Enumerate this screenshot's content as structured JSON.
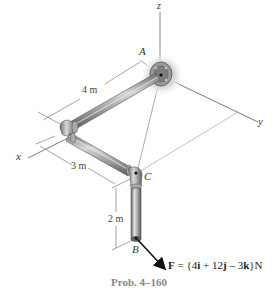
{
  "figure": {
    "caption": "Prob. 4–160",
    "axes": {
      "x": "x",
      "y": "y",
      "z": "z"
    },
    "points": {
      "A": "A",
      "B": "B",
      "C": "C"
    },
    "dimensions": {
      "AD": "4 m",
      "DC": "3 m",
      "CB": "2 m"
    },
    "force_label": "F = {4i + 12j – 3k} N",
    "colors": {
      "pipe": "#b8b8b8",
      "pipe_dark": "#7a7a7a",
      "line": "#555555",
      "arrow": "#111111"
    }
  }
}
